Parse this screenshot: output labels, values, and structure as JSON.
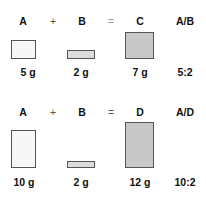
{
  "rows": [
    {
      "terms": [
        "A",
        "+",
        "B",
        "=",
        "C",
        "A/B"
      ],
      "values": [
        "5 g",
        "2 g",
        "7 g",
        "5:2"
      ]
    },
    {
      "terms": [
        "A",
        "+",
        "B",
        "=",
        "D",
        "A/D"
      ],
      "values": [
        "10 g",
        "2 g",
        "12 g",
        "10:2"
      ]
    }
  ]
}
